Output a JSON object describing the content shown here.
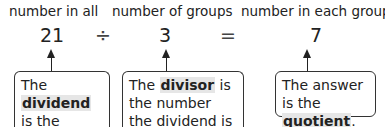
{
  "labels": {
    "dividend_label": "number in all",
    "divisor_label": "number of groups",
    "quotient_label": "number in each group"
  },
  "equation": {
    "dividend": "21",
    "divide_sign": "÷",
    "divisor": "3",
    "equals_sign": "=",
    "quotient": "7"
  },
  "boxes": {
    "dividend": {
      "pre": "The ",
      "term": "dividend",
      "post": " is the number to be divided."
    },
    "divisor": {
      "pre": "The ",
      "term": "divisor",
      "post": " is the number the dividend is divided by."
    },
    "quotient": {
      "pre": "The answer is the ",
      "term": "quotient",
      "post": "."
    }
  }
}
